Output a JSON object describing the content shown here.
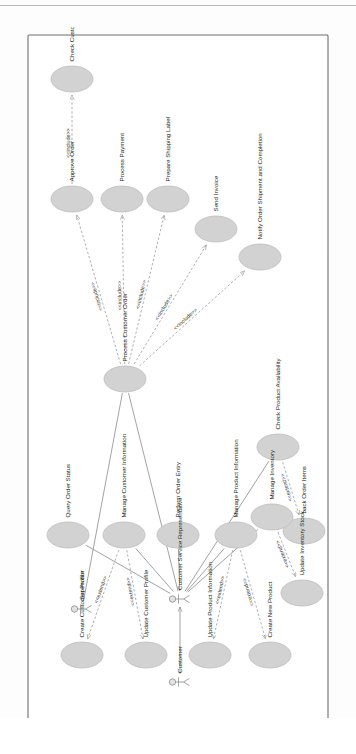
{
  "diagram": {
    "type": "uml-use-case-diagram",
    "orientation": "rotated-90-ccw",
    "system_boundary_label": "",
    "colors": {
      "usecase_fill": "#d2d2d2",
      "usecase_stroke": "#bdbdbd",
      "boundary_stroke": "#6f6f6f",
      "association_stroke": "#8a8a8a",
      "dependency_stroke": "#9a9a9a",
      "text": "#1b1b1b",
      "page_background": "#ffffff"
    },
    "actors": [
      {
        "id": "supervisor",
        "label": "Supervisor",
        "x": 118,
        "y": 62
      },
      {
        "id": "customer",
        "label": "Customer",
        "x": 45,
        "y": 160
      },
      {
        "id": "csr",
        "label": "Customer Service Representative",
        "x": 128,
        "y": 160
      }
    ],
    "use_cases": [
      {
        "id": "check_credit",
        "label": "Check Customer Credit",
        "x": 648,
        "y": 52
      },
      {
        "id": "approve_order",
        "label": "Approve Order",
        "x": 528,
        "y": 52
      },
      {
        "id": "process_payment",
        "label": "Process Payment",
        "x": 528,
        "y": 102
      },
      {
        "id": "ship_label",
        "label": "Prepare Shipping Label",
        "x": 528,
        "y": 148
      },
      {
        "id": "send_invoice",
        "label": "Send Invoice",
        "x": 498,
        "y": 196
      },
      {
        "id": "notify_ship",
        "label": "Notify Order Shipment and Completion",
        "x": 470,
        "y": 240
      },
      {
        "id": "process_order",
        "label": "Process Customer Order",
        "x": 348,
        "y": 105
      },
      {
        "id": "check_avail",
        "label": "Check Product Availability",
        "x": 280,
        "y": 258
      },
      {
        "id": "back_order",
        "label": "back Order Items",
        "x": 196,
        "y": 284
      },
      {
        "id": "manage_inv",
        "label": "Manage Inventory",
        "x": 210,
        "y": 252
      },
      {
        "id": "update_stock",
        "label": "Update Inventory Stock",
        "x": 134,
        "y": 282
      },
      {
        "id": "query_status",
        "label": "Query Order Status",
        "x": 192,
        "y": 48
      },
      {
        "id": "manage_cust",
        "label": "Manage Customer Information",
        "x": 192,
        "y": 104
      },
      {
        "id": "order_entry",
        "label": "Perform Order Entry",
        "x": 192,
        "y": 158
      },
      {
        "id": "manage_prod",
        "label": "Manage Product Information",
        "x": 192,
        "y": 216
      },
      {
        "id": "create_cust",
        "label": "Create Customer Profile",
        "x": 72,
        "y": 62
      },
      {
        "id": "update_cust",
        "label": "Update Customer Profile",
        "x": 72,
        "y": 126
      },
      {
        "id": "update_prod",
        "label": "Update Product Information",
        "x": 72,
        "y": 190
      },
      {
        "id": "create_prod",
        "label": "Create New Product",
        "x": 72,
        "y": 250
      }
    ],
    "relationship_labels": {
      "include": "<<include>>",
      "extend": "<<extend>>"
    },
    "relationships": [
      {
        "from": "approve_order",
        "to": "check_credit",
        "kind": "include"
      },
      {
        "from": "process_order",
        "to": "approve_order",
        "kind": "include"
      },
      {
        "from": "process_order",
        "to": "process_payment",
        "kind": "include"
      },
      {
        "from": "process_order",
        "to": "ship_label",
        "kind": "include"
      },
      {
        "from": "process_order",
        "to": "send_invoice",
        "kind": "include"
      },
      {
        "from": "process_order",
        "to": "notify_ship",
        "kind": "include"
      },
      {
        "from": "manage_cust",
        "to": "create_cust",
        "kind": "extend"
      },
      {
        "from": "manage_cust",
        "to": "update_cust",
        "kind": "extend"
      },
      {
        "from": "manage_prod",
        "to": "update_prod",
        "kind": "extend"
      },
      {
        "from": "manage_prod",
        "to": "create_prod",
        "kind": "extend"
      },
      {
        "from": "check_avail",
        "to": "back_order",
        "kind": "extend"
      },
      {
        "from": "manage_inv",
        "to": "back_order",
        "kind": "extend"
      },
      {
        "from": "manage_inv",
        "to": "update_stock",
        "kind": "extend"
      }
    ],
    "associations": [
      {
        "from": "customer",
        "to": "csr"
      },
      {
        "from": "supervisor",
        "to": "process_order"
      },
      {
        "from": "csr",
        "to": "process_order"
      },
      {
        "from": "csr",
        "to": "query_status"
      },
      {
        "from": "csr",
        "to": "manage_cust"
      },
      {
        "from": "csr",
        "to": "order_entry"
      },
      {
        "from": "csr",
        "to": "manage_prod"
      },
      {
        "from": "csr",
        "to": "check_avail"
      },
      {
        "from": "csr",
        "to": "manage_inv"
      }
    ]
  }
}
